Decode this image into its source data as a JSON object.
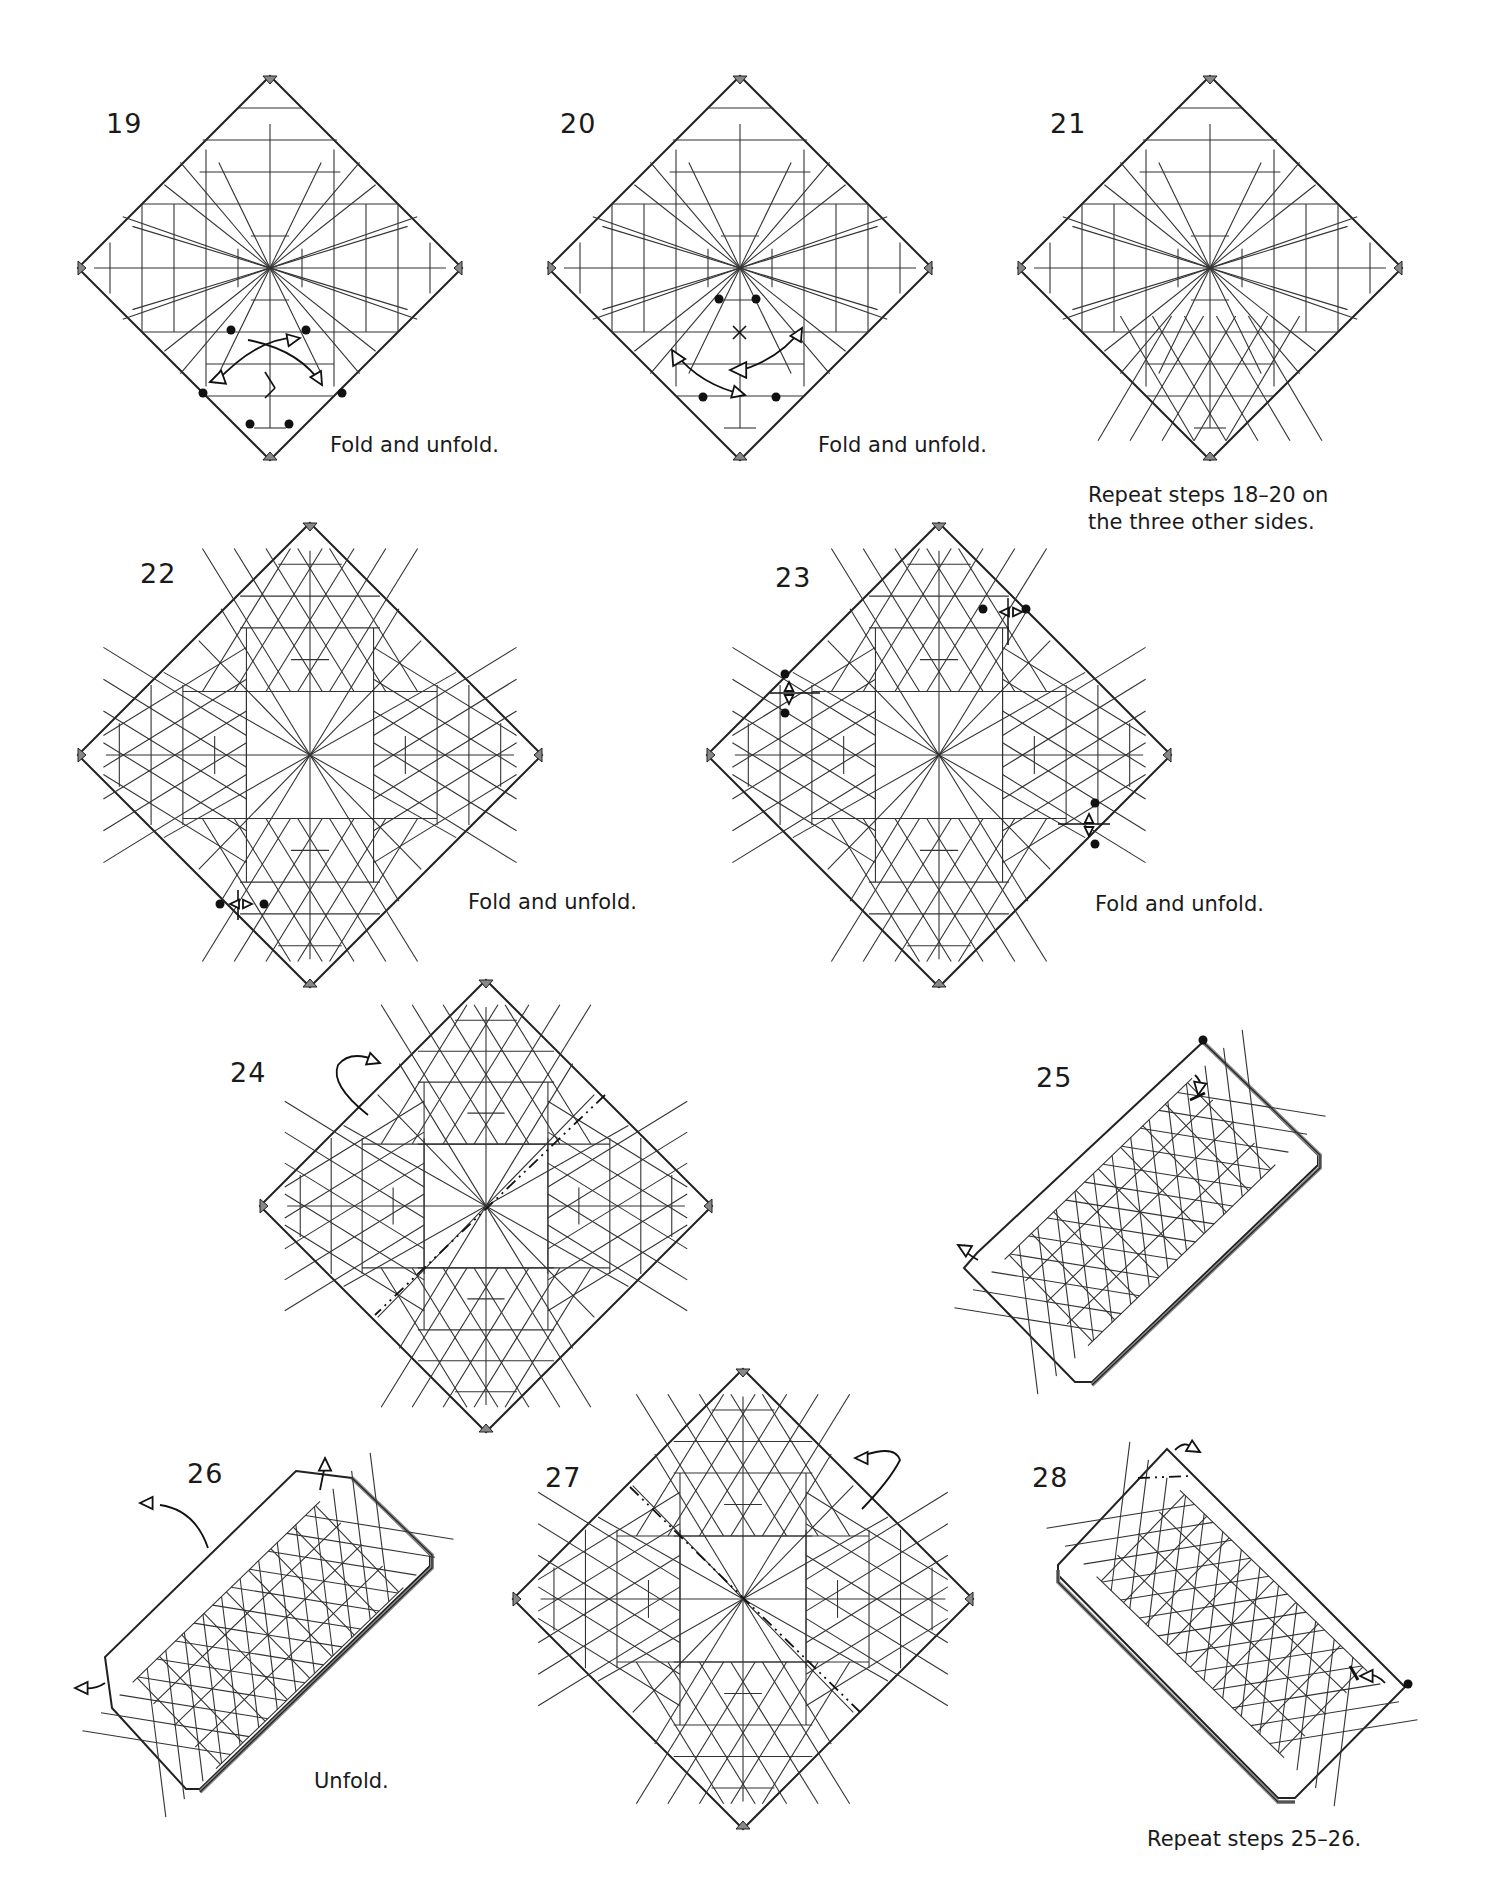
{
  "page": {
    "background": "#ffffff",
    "line_color": "#222222",
    "crease_color": "#333333",
    "fold_layer_color": "#888888"
  },
  "steps": [
    {
      "number": "19",
      "caption": "Fold and unfold.",
      "shape": "square",
      "pattern": "grid-sparse",
      "symbols": [
        "dots",
        "valley-fold-arrows"
      ]
    },
    {
      "number": "20",
      "caption": "Fold and unfold.",
      "shape": "square",
      "pattern": "grid-sparse",
      "symbols": [
        "dots",
        "valley-fold-arrows"
      ]
    },
    {
      "number": "21",
      "caption": "",
      "shape": "square",
      "pattern": "grid-sparse-bottom-triangles",
      "symbols": []
    },
    {
      "number": "",
      "caption": "Repeat steps 18–20 on\nthe three other sides.",
      "shape": "none",
      "pattern": "",
      "symbols": []
    },
    {
      "number": "22",
      "caption": "Fold and unfold.",
      "shape": "square",
      "pattern": "triangle-grid",
      "symbols": [
        "dots",
        "fold-unfold-arrow"
      ]
    },
    {
      "number": "23",
      "caption": "Fold and unfold.",
      "shape": "square",
      "pattern": "triangle-grid",
      "symbols": [
        "dots",
        "fold-unfold-arrows"
      ]
    },
    {
      "number": "24",
      "caption": "",
      "shape": "square",
      "pattern": "triangle-grid",
      "symbols": [
        "mountain-fold-line",
        "turn-over-arrow"
      ]
    },
    {
      "number": "25",
      "caption": "",
      "shape": "rectangle",
      "pattern": "triangle-grid",
      "symbols": [
        "dot",
        "fold-arrow",
        "mountain-fold-arrow"
      ]
    },
    {
      "number": "26",
      "caption": "Unfold.",
      "shape": "rectangle",
      "pattern": "triangle-grid",
      "symbols": [
        "unfold-arrows"
      ]
    },
    {
      "number": "27",
      "caption": "",
      "shape": "square",
      "pattern": "triangle-grid",
      "symbols": [
        "mountain-fold-line",
        "turn-over-arrow"
      ]
    },
    {
      "number": "28",
      "caption": "Repeat steps 25–26.",
      "shape": "rectangle",
      "pattern": "triangle-grid",
      "symbols": [
        "dot",
        "fold-arrow",
        "mountain-fold-arrow"
      ]
    }
  ]
}
